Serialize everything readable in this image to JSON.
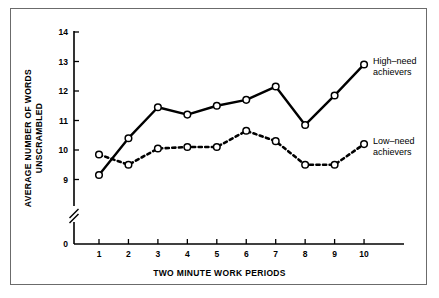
{
  "chart_data": {
    "type": "line",
    "title": "",
    "xlabel": "TWO MINUTE WORK PERIODS",
    "ylabel": "AVERAGE NUMBER OF WORDS UNSCRAMBLED",
    "ylabel_line1": "AVERAGE NUMBER OF WORDS",
    "ylabel_line2": "UNSCRAMBLED",
    "categories": [
      1,
      2,
      3,
      4,
      5,
      6,
      7,
      8,
      9,
      10
    ],
    "x_tick_labels": [
      "1",
      "2",
      "3",
      "4",
      "5",
      "6",
      "7",
      "8",
      "9",
      "10"
    ],
    "y_tick_labels": [
      "0",
      "9",
      "10",
      "11",
      "12",
      "13",
      "14"
    ],
    "y_ticks": [
      9,
      10,
      11,
      12,
      13,
      14
    ],
    "ylim": [
      9,
      14
    ],
    "axis_break": true,
    "axis_break_symbol": "//",
    "grid": false,
    "legend_position": "right-inline",
    "series": [
      {
        "name": "High–need achievers",
        "label_line1": "High–need",
        "label_line2": "achievers",
        "style": "solid",
        "color": "#000000",
        "marker": "open-circle",
        "values": [
          9.15,
          10.4,
          11.45,
          11.2,
          11.5,
          11.7,
          12.15,
          10.85,
          11.85,
          12.9
        ]
      },
      {
        "name": "Low–need achievers",
        "label_line1": "Low–need",
        "label_line2": "achievers",
        "style": "dashed",
        "color": "#000000",
        "marker": "open-circle",
        "values": [
          9.85,
          9.5,
          10.05,
          10.1,
          10.1,
          10.65,
          10.3,
          9.5,
          9.5,
          10.2
        ]
      }
    ]
  },
  "colors": {
    "frame_border": "#6b6b6b",
    "axis": "#000000",
    "line": "#000000",
    "background": "#ffffff"
  }
}
